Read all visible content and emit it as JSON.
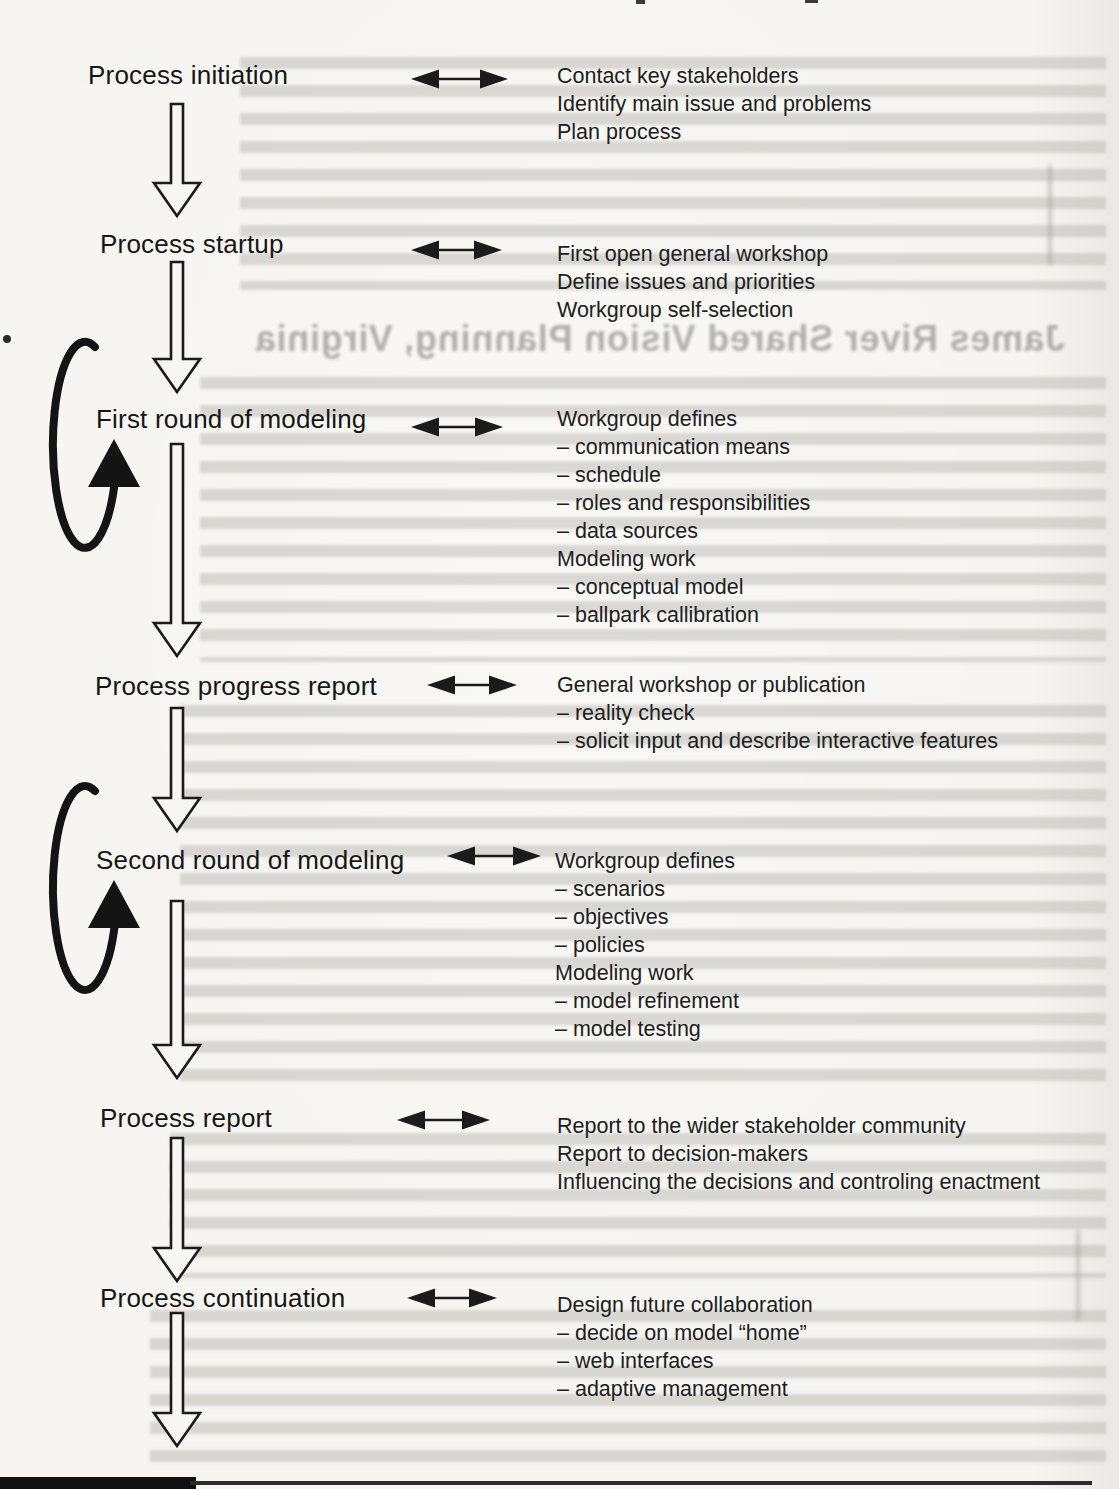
{
  "bleedthrough": {
    "heading": "James River Shared Vision Planning, Virginia"
  },
  "colors": {
    "ink": "#1b1b1b",
    "paper": "#f6f5f1",
    "bleed_gray": "#aeada7"
  },
  "stages": [
    {
      "label": "Process initiation",
      "lines": [
        "Contact key stakeholders",
        "Identify main issue and problems",
        "Plan process"
      ]
    },
    {
      "label": "Process startup",
      "lines": [
        "First open general workshop",
        "Define issues and priorities",
        "Workgroup self-selection"
      ]
    },
    {
      "label": "First round of modeling",
      "lines": [
        "Workgroup defines",
        "– communication means",
        "– schedule",
        "– roles and responsibilities",
        "– data sources",
        "Modeling work",
        "– conceptual model",
        "– ballpark callibration"
      ]
    },
    {
      "label": "Process progress report",
      "lines": [
        "General workshop or publication",
        "– reality check",
        "– solicit input and describe interactive features"
      ]
    },
    {
      "label": "Second round of modeling",
      "lines": [
        "Workgroup defines",
        "– scenarios",
        "– objectives",
        "– policies",
        "Modeling work",
        "– model refinement",
        "– model testing"
      ]
    },
    {
      "label": "Process report",
      "lines": [
        "Report to the wider stakeholder community",
        "Report to decision-makers",
        "Influencing the decisions and controling enactment"
      ]
    },
    {
      "label": "Process continuation",
      "lines": [
        "Design future collaboration",
        "– decide on model “home”",
        "– web interfaces",
        "– adaptive management"
      ]
    }
  ]
}
